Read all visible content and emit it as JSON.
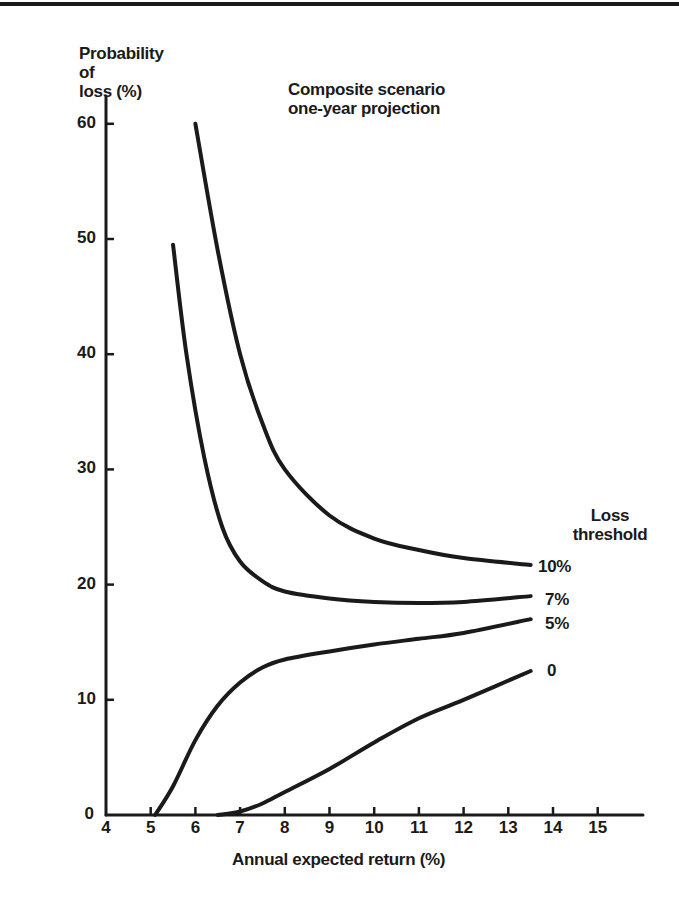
{
  "chart_data": {
    "type": "line",
    "title": "Composite scenario one-year projection",
    "title_lines": [
      "Composite scenario",
      "one-year projection"
    ],
    "xlabel": "Annual expected return (%)",
    "ylabel": "Probability of loss (%)",
    "ylabel_lines": [
      "Probability",
      "of",
      "loss (%)"
    ],
    "xlim": [
      4,
      16
    ],
    "ylim": [
      0,
      62
    ],
    "x_ticks": [
      "4",
      "5",
      "6",
      "7",
      "8",
      "9",
      "10",
      "11",
      "12",
      "13",
      "14",
      "15"
    ],
    "y_ticks": [
      "0",
      "10",
      "20",
      "30",
      "40",
      "50",
      "60"
    ],
    "grid": false,
    "legend_title_lines": [
      "Loss",
      "threshold"
    ],
    "legend_position": "right, inline labels at curve ends",
    "series": [
      {
        "name": "10%",
        "x": [
          6.0,
          6.5,
          7.0,
          7.5,
          8.0,
          9.0,
          10.0,
          11.0,
          12.0,
          13.5
        ],
        "y": [
          60,
          49,
          40,
          34,
          30,
          26,
          24,
          23,
          22.3,
          21.7
        ]
      },
      {
        "name": "7%",
        "x": [
          5.5,
          5.8,
          6.2,
          6.6,
          7.0,
          7.5,
          8.0,
          9.0,
          10.0,
          11.0,
          12.0,
          13.5
        ],
        "y": [
          49.5,
          40,
          31,
          25,
          22,
          20.3,
          19.4,
          18.8,
          18.5,
          18.4,
          18.5,
          19.0
        ]
      },
      {
        "name": "5%",
        "x": [
          5.1,
          5.5,
          6.0,
          6.5,
          7.0,
          7.5,
          8.0,
          9.0,
          10.0,
          11.0,
          12.0,
          13.5
        ],
        "y": [
          0,
          2.5,
          6.5,
          9.5,
          11.5,
          12.8,
          13.5,
          14.2,
          14.8,
          15.3,
          15.8,
          17.0
        ]
      },
      {
        "name": "0",
        "x": [
          6.5,
          7.0,
          7.5,
          8.0,
          9.0,
          10.0,
          11.0,
          12.0,
          13.5
        ],
        "y": [
          0,
          0.3,
          1.0,
          2.0,
          4.0,
          6.3,
          8.4,
          10.0,
          12.5
        ]
      }
    ]
  }
}
